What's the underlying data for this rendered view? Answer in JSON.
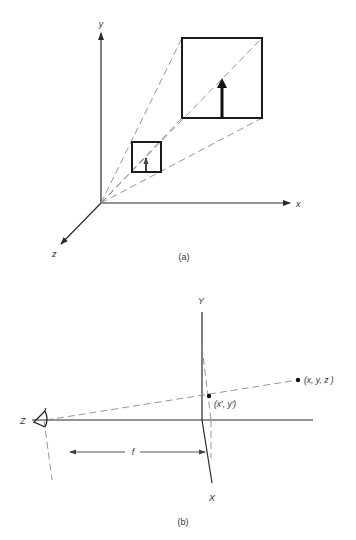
{
  "figure_a": {
    "caption": "(a)",
    "axis_labels": {
      "y": "y",
      "x": "x",
      "z": "z"
    },
    "origin": [
      101,
      203
    ],
    "near_square": {
      "x": 132,
      "y": 142,
      "size": 29
    },
    "far_square": {
      "x": 182,
      "y": 38,
      "size": 80
    },
    "near_arrow": {
      "x": 146,
      "y_base": 172,
      "y_tip": 157
    },
    "far_arrow": {
      "x": 222,
      "y_base": 118,
      "y_tip": 80
    }
  },
  "figure_b": {
    "caption": "(b)",
    "axis_labels": {
      "Y": "Y",
      "X": "X",
      "Z": "Z"
    },
    "focal_length_label": "f",
    "point_3d_label": "(x, y, z )",
    "point_image_label": "(x′, y′)",
    "point_3d": [
      298,
      380
    ],
    "point_image": [
      209,
      396
    ],
    "eye": [
      44,
      420
    ],
    "optical_axis_y": 420
  },
  "colors": {
    "line": "#2a2a2a",
    "dashed": "#8a8a8a",
    "text": "#333333",
    "background": "#ffffff"
  }
}
